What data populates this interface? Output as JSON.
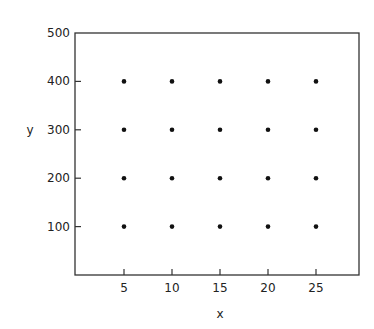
{
  "chart_data": {
    "type": "scatter",
    "title": "",
    "xlabel": "x",
    "ylabel": "y",
    "xlim": [
      0,
      30
    ],
    "ylim": [
      0,
      500
    ],
    "x_ticks": [
      5,
      10,
      15,
      20,
      25
    ],
    "y_ticks": [
      100,
      200,
      300,
      400,
      500
    ],
    "grid": false,
    "legend": null,
    "points": [
      {
        "x": 5,
        "y": 100
      },
      {
        "x": 10,
        "y": 100
      },
      {
        "x": 15,
        "y": 100
      },
      {
        "x": 20,
        "y": 100
      },
      {
        "x": 25,
        "y": 100
      },
      {
        "x": 5,
        "y": 200
      },
      {
        "x": 10,
        "y": 200
      },
      {
        "x": 15,
        "y": 200
      },
      {
        "x": 20,
        "y": 200
      },
      {
        "x": 25,
        "y": 200
      },
      {
        "x": 5,
        "y": 300
      },
      {
        "x": 10,
        "y": 300
      },
      {
        "x": 15,
        "y": 300
      },
      {
        "x": 20,
        "y": 300
      },
      {
        "x": 25,
        "y": 300
      },
      {
        "x": 5,
        "y": 400
      },
      {
        "x": 10,
        "y": 400
      },
      {
        "x": 15,
        "y": 400
      },
      {
        "x": 20,
        "y": 400
      },
      {
        "x": 25,
        "y": 400
      }
    ]
  },
  "style": {
    "axis_color": "#333333",
    "point_color": "#111111"
  }
}
